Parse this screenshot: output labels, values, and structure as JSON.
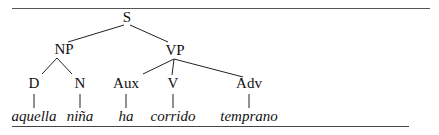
{
  "tree": {
    "root": {
      "label": "S"
    },
    "phrases": [
      {
        "label": "NP"
      },
      {
        "label": "VP"
      }
    ],
    "categories": [
      {
        "label": "D"
      },
      {
        "label": "N"
      },
      {
        "label": "Aux"
      },
      {
        "label": "V"
      },
      {
        "label": "Adv"
      }
    ],
    "words": [
      {
        "text": "aquella"
      },
      {
        "text": "niña"
      },
      {
        "text": "ha"
      },
      {
        "text": "corrido"
      },
      {
        "text": "temprano"
      }
    ]
  }
}
